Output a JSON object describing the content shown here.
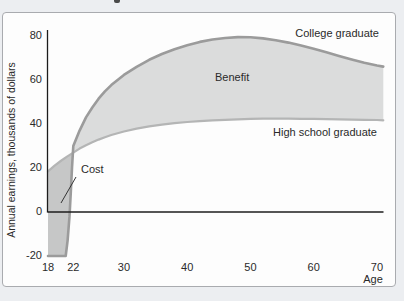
{
  "figure": {
    "curve_label_college": "College graduate",
    "curve_label_highschool": "High school graduate",
    "region_label_benefit": "Benefit",
    "region_label_cost": "Cost",
    "x_axis_title": "Age",
    "y_axis_title": "Annual earnings, thousands of dollars"
  },
  "colors": {
    "college_line": "#9b9b9b",
    "highschool_line": "#b4b5b5",
    "benefit_fill": "#dbdcdc",
    "cost_fill": "#c6c7c7",
    "axis_line": "#1c1c1c",
    "leader_line": "#333333",
    "frame_border": "#a9abaf",
    "plot_background": "#fdfdfd",
    "page_background": "#eceef1"
  },
  "chart_data": {
    "type": "area",
    "title": "",
    "xlabel": "Age",
    "ylabel": "Annual earnings, thousands of dollars",
    "x_ticks": [
      18,
      22,
      30,
      40,
      50,
      60,
      70
    ],
    "y_ticks": [
      80,
      60,
      40,
      20,
      0,
      -20
    ],
    "xlim": [
      18,
      71
    ],
    "ylim": [
      -20,
      85
    ],
    "grid": false,
    "legend_position": "labels-on-chart",
    "regions": [
      {
        "label": "Benefit"
      },
      {
        "label": "Cost"
      }
    ],
    "series": [
      {
        "name": "College graduate",
        "points": [
          [
            18,
            -20
          ],
          [
            20.8,
            -20
          ],
          [
            21.1,
            -13
          ],
          [
            21.4,
            -2
          ],
          [
            21.6,
            9
          ],
          [
            21.8,
            20
          ],
          [
            22,
            30
          ],
          [
            23,
            37
          ],
          [
            24,
            43
          ],
          [
            25,
            47.5
          ],
          [
            26,
            51.5
          ],
          [
            27,
            54.8
          ],
          [
            28,
            57.7
          ],
          [
            30,
            62.3
          ],
          [
            32,
            66
          ],
          [
            34,
            69.2
          ],
          [
            36,
            71.8
          ],
          [
            38,
            74
          ],
          [
            40,
            75.8
          ],
          [
            42,
            77.3
          ],
          [
            44,
            78.4
          ],
          [
            46,
            79.1
          ],
          [
            48,
            79.5
          ],
          [
            50,
            79.4
          ],
          [
            52,
            78.9
          ],
          [
            54,
            78.1
          ],
          [
            56,
            77
          ],
          [
            58,
            75.7
          ],
          [
            60,
            74.2
          ],
          [
            62,
            72.6
          ],
          [
            64,
            70.9
          ],
          [
            66,
            69.3
          ],
          [
            68,
            67.8
          ],
          [
            70,
            66.6
          ],
          [
            71,
            66.1
          ]
        ]
      },
      {
        "name": "High school graduate",
        "points": [
          [
            18,
            18.5
          ],
          [
            19,
            21
          ],
          [
            20,
            23.2
          ],
          [
            21,
            25.2
          ],
          [
            22,
            27
          ],
          [
            23,
            28.8
          ],
          [
            24,
            30.3
          ],
          [
            25,
            31.7
          ],
          [
            26,
            32.9
          ],
          [
            27,
            34
          ],
          [
            28,
            35
          ],
          [
            30,
            36.6
          ],
          [
            32,
            37.9
          ],
          [
            34,
            38.9
          ],
          [
            36,
            39.7
          ],
          [
            38,
            40.4
          ],
          [
            40,
            40.9
          ],
          [
            42,
            41.3
          ],
          [
            44,
            41.7
          ],
          [
            46,
            41.9
          ],
          [
            48,
            42.1
          ],
          [
            50,
            42.3
          ],
          [
            52,
            42.4
          ],
          [
            54,
            42.4
          ],
          [
            56,
            42.4
          ],
          [
            58,
            42.3
          ],
          [
            60,
            42.3
          ],
          [
            62,
            42.2
          ],
          [
            64,
            42.1
          ],
          [
            66,
            42
          ],
          [
            68,
            41.9
          ],
          [
            70,
            41.8
          ],
          [
            71,
            41.7
          ]
        ]
      }
    ]
  }
}
